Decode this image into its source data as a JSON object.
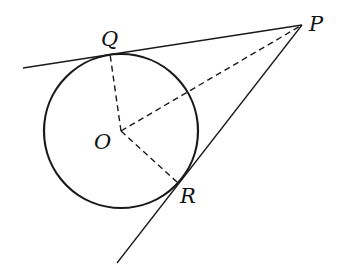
{
  "diagram": {
    "labels": {
      "P": "P",
      "Q": "Q",
      "O": "O",
      "R": "R"
    },
    "points": {
      "P": [
        302,
        25
      ],
      "Q": [
        110,
        54
      ],
      "O": [
        121,
        131
      ],
      "R": [
        177,
        182
      ]
    },
    "circle": {
      "cx": 121,
      "cy": 131,
      "r": 77
    },
    "colors": {
      "stroke": "#1a1a1a",
      "background": "#ffffff"
    }
  }
}
